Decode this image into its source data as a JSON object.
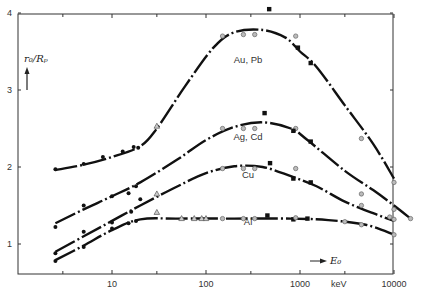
{
  "chart_data": {
    "type": "line",
    "title": "",
    "xlabel": "E0",
    "xunit": "keV",
    "ylabel": "r0/Rp",
    "xscale": "log",
    "xlim": [
      1,
      10000
    ],
    "ylim": [
      0.58,
      4.0
    ],
    "grid": false,
    "x_ticks": [
      {
        "value": 10,
        "label": "10"
      },
      {
        "value": 100,
        "label": "100"
      },
      {
        "value": 1000,
        "label": "1000"
      },
      {
        "value": 10000,
        "label": "10000"
      }
    ],
    "x_minor_ticks": [
      3,
      30,
      300,
      3000
    ],
    "y_ticks": [
      {
        "value": 1,
        "label": "1"
      },
      {
        "value": 2,
        "label": "2"
      },
      {
        "value": 3,
        "label": "3"
      },
      {
        "value": 4,
        "label": "4"
      }
    ],
    "series": [
      {
        "name": "Au, Pb",
        "label_at": [
          280,
          3.3
        ],
        "curve": [
          [
            2.5,
            1.96
          ],
          [
            5,
            2.03
          ],
          [
            10,
            2.13
          ],
          [
            20,
            2.27
          ],
          [
            30,
            2.5
          ],
          [
            60,
            3.05
          ],
          [
            120,
            3.55
          ],
          [
            200,
            3.75
          ],
          [
            400,
            3.78
          ],
          [
            700,
            3.68
          ],
          [
            1000,
            3.5
          ],
          [
            1500,
            3.3
          ],
          [
            3000,
            2.8
          ],
          [
            6000,
            2.3
          ],
          [
            10000,
            1.85
          ]
        ],
        "points": [
          {
            "x": 2.5,
            "y": 1.97,
            "m": "dot"
          },
          {
            "x": 5,
            "y": 2.04,
            "m": "dot"
          },
          {
            "x": 8,
            "y": 2.13,
            "m": "dot"
          },
          {
            "x": 13,
            "y": 2.2,
            "m": "dot"
          },
          {
            "x": 17,
            "y": 2.26,
            "m": "dot"
          },
          {
            "x": 19,
            "y": 2.25,
            "m": "dot"
          },
          {
            "x": 30,
            "y": 2.53,
            "m": "tri"
          },
          {
            "x": 150,
            "y": 3.7,
            "m": "circ"
          },
          {
            "x": 250,
            "y": 3.72,
            "m": "circ"
          },
          {
            "x": 330,
            "y": 3.72,
            "m": "circ"
          },
          {
            "x": 470,
            "y": 4.05,
            "m": "sq"
          },
          {
            "x": 900,
            "y": 3.7,
            "m": "circ"
          },
          {
            "x": 950,
            "y": 3.55,
            "m": "sq"
          },
          {
            "x": 1300,
            "y": 3.35,
            "m": "sq"
          },
          {
            "x": 4500,
            "y": 2.37,
            "m": "circ"
          },
          {
            "x": 10000,
            "y": 1.8,
            "m": "circ"
          }
        ]
      },
      {
        "name": "Ag, Cd",
        "label_at": [
          280,
          2.3
        ],
        "curve": [
          [
            2.5,
            1.27
          ],
          [
            5,
            1.45
          ],
          [
            10,
            1.62
          ],
          [
            20,
            1.8
          ],
          [
            50,
            2.1
          ],
          [
            100,
            2.35
          ],
          [
            200,
            2.52
          ],
          [
            400,
            2.58
          ],
          [
            800,
            2.5
          ],
          [
            1200,
            2.35
          ],
          [
            3000,
            1.95
          ],
          [
            6000,
            1.7
          ],
          [
            10000,
            1.5
          ],
          [
            15000,
            1.33
          ]
        ],
        "points": [
          {
            "x": 2.5,
            "y": 1.22,
            "m": "dot"
          },
          {
            "x": 5,
            "y": 1.5,
            "m": "dot"
          },
          {
            "x": 10,
            "y": 1.62,
            "m": "dot"
          },
          {
            "x": 15,
            "y": 1.66,
            "m": "dot"
          },
          {
            "x": 18,
            "y": 1.75,
            "m": "dot"
          },
          {
            "x": 150,
            "y": 2.5,
            "m": "circ"
          },
          {
            "x": 250,
            "y": 2.5,
            "m": "circ"
          },
          {
            "x": 330,
            "y": 2.5,
            "m": "circ"
          },
          {
            "x": 420,
            "y": 2.7,
            "m": "sq"
          },
          {
            "x": 900,
            "y": 2.5,
            "m": "circ"
          },
          {
            "x": 850,
            "y": 2.47,
            "m": "sq"
          },
          {
            "x": 1300,
            "y": 2.33,
            "m": "sq"
          },
          {
            "x": 4500,
            "y": 1.65,
            "m": "circ"
          },
          {
            "x": 10000,
            "y": 1.45,
            "m": "circ"
          },
          {
            "x": 15000,
            "y": 1.33,
            "m": "circ"
          }
        ]
      },
      {
        "name": "Cu",
        "label_at": [
          280,
          1.8
        ],
        "curve": [
          [
            2.5,
            0.9
          ],
          [
            5,
            1.1
          ],
          [
            10,
            1.3
          ],
          [
            20,
            1.5
          ],
          [
            50,
            1.75
          ],
          [
            100,
            1.92
          ],
          [
            200,
            2.01
          ],
          [
            400,
            2.0
          ],
          [
            800,
            1.88
          ],
          [
            1500,
            1.75
          ],
          [
            3000,
            1.55
          ],
          [
            6000,
            1.4
          ],
          [
            10000,
            1.3
          ]
        ],
        "points": [
          {
            "x": 2.5,
            "y": 0.88,
            "m": "dot"
          },
          {
            "x": 5,
            "y": 1.16,
            "m": "dot"
          },
          {
            "x": 10,
            "y": 1.28,
            "m": "dot"
          },
          {
            "x": 16,
            "y": 1.42,
            "m": "dot"
          },
          {
            "x": 20,
            "y": 1.58,
            "m": "dot"
          },
          {
            "x": 30,
            "y": 1.65,
            "m": "tri"
          },
          {
            "x": 150,
            "y": 1.98,
            "m": "circ"
          },
          {
            "x": 250,
            "y": 1.98,
            "m": "circ"
          },
          {
            "x": 330,
            "y": 1.98,
            "m": "circ"
          },
          {
            "x": 480,
            "y": 2.05,
            "m": "sq"
          },
          {
            "x": 900,
            "y": 1.98,
            "m": "circ"
          },
          {
            "x": 850,
            "y": 1.85,
            "m": "sq"
          },
          {
            "x": 1300,
            "y": 1.8,
            "m": "sq"
          },
          {
            "x": 4500,
            "y": 1.5,
            "m": "circ"
          },
          {
            "x": 9000,
            "y": 1.35,
            "m": "circ"
          },
          {
            "x": 10000,
            "y": 1.32,
            "m": "circ"
          }
        ]
      },
      {
        "name": "Al",
        "label_at": [
          280,
          1.2
        ],
        "curve": [
          [
            2.5,
            0.79
          ],
          [
            5,
            0.98
          ],
          [
            10,
            1.18
          ],
          [
            20,
            1.32
          ],
          [
            50,
            1.33
          ],
          [
            200,
            1.33
          ],
          [
            800,
            1.33
          ],
          [
            2000,
            1.31
          ],
          [
            5000,
            1.25
          ],
          [
            10000,
            1.12
          ]
        ],
        "points": [
          {
            "x": 2.5,
            "y": 0.78,
            "m": "dot"
          },
          {
            "x": 5,
            "y": 0.96,
            "m": "dot"
          },
          {
            "x": 10,
            "y": 1.2,
            "m": "dot"
          },
          {
            "x": 15,
            "y": 1.27,
            "m": "dot"
          },
          {
            "x": 18,
            "y": 1.3,
            "m": "dot"
          },
          {
            "x": 30,
            "y": 1.41,
            "m": "tri"
          },
          {
            "x": 55,
            "y": 1.33,
            "m": "tri"
          },
          {
            "x": 75,
            "y": 1.33,
            "m": "tri"
          },
          {
            "x": 90,
            "y": 1.33,
            "m": "tri"
          },
          {
            "x": 100,
            "y": 1.33,
            "m": "tri"
          },
          {
            "x": 150,
            "y": 1.33,
            "m": "circ"
          },
          {
            "x": 250,
            "y": 1.33,
            "m": "circ"
          },
          {
            "x": 330,
            "y": 1.33,
            "m": "circ"
          },
          {
            "x": 450,
            "y": 1.37,
            "m": "sq"
          },
          {
            "x": 850,
            "y": 1.32,
            "m": "sq"
          },
          {
            "x": 900,
            "y": 1.34,
            "m": "circ"
          },
          {
            "x": 1200,
            "y": 1.33,
            "m": "sq"
          },
          {
            "x": 3000,
            "y": 1.29,
            "m": "circ"
          },
          {
            "x": 4500,
            "y": 1.25,
            "m": "circ"
          },
          {
            "x": 10000,
            "y": 1.12,
            "m": "circ"
          }
        ]
      }
    ]
  },
  "labels": {
    "y_axis": "r₀/Rₚ",
    "x_axis": "E₀",
    "x_unit": "keV"
  }
}
